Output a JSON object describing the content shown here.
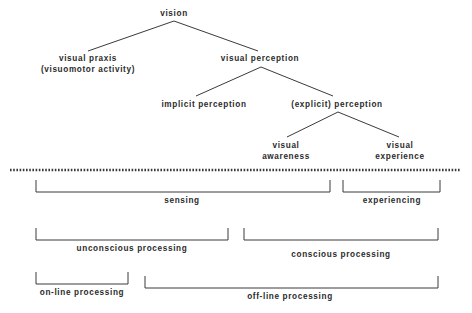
{
  "figure": {
    "ink_color": "#3a3a3a",
    "text_color": "#2b2b2b",
    "background": "#ffffff"
  },
  "tree": {
    "nodes": [
      {
        "id": "vision",
        "label": "vision",
        "x": 174,
        "y": 13,
        "level": 0
      },
      {
        "id": "visual-praxis",
        "label": "visual praxis",
        "x": 88,
        "y": 58,
        "level": 1
      },
      {
        "id": "visuomotor-activity",
        "label": "(visuomotor activity)",
        "x": 88,
        "y": 70,
        "level": 1
      },
      {
        "id": "visual-perception",
        "label": "visual perception",
        "x": 260,
        "y": 58,
        "level": 1
      },
      {
        "id": "implicit-perception",
        "label": "implicit perception",
        "x": 204,
        "y": 104,
        "level": 2
      },
      {
        "id": "explicit-perception",
        "label": "(explicit) perception",
        "x": 337,
        "y": 104,
        "level": 2
      },
      {
        "id": "visual-awareness-1",
        "label": "visual",
        "x": 286,
        "y": 145,
        "level": 3
      },
      {
        "id": "visual-awareness-2",
        "label": "awareness",
        "x": 286,
        "y": 155,
        "level": 3
      },
      {
        "id": "visual-experience-1",
        "label": "visual",
        "x": 400,
        "y": 145,
        "level": 3
      },
      {
        "id": "visual-experience-2",
        "label": "experience",
        "x": 400,
        "y": 155,
        "level": 3
      }
    ],
    "edges": [
      {
        "from": "vision",
        "to": "visual-praxis"
      },
      {
        "from": "vision",
        "to": "visual-perception"
      },
      {
        "from": "visual-perception",
        "to": "implicit-perception"
      },
      {
        "from": "visual-perception",
        "to": "explicit-perception"
      },
      {
        "from": "explicit-perception",
        "to": "visual-awareness"
      },
      {
        "from": "explicit-perception",
        "to": "visual-experience"
      }
    ]
  },
  "divider": {
    "name": "dotted-divider",
    "style": "dotted",
    "x_start": 10,
    "x_end": 461,
    "y": 170
  },
  "brackets": [
    {
      "id": "sensing",
      "label": "sensing",
      "x_start": 36,
      "x_end": 330,
      "top": 180,
      "bottom": 192,
      "label_x": 182,
      "label_y": 196,
      "row": 1
    },
    {
      "id": "experiencing",
      "label": "experiencing",
      "x_start": 343,
      "x_end": 440,
      "top": 180,
      "bottom": 192,
      "label_x": 392,
      "label_y": 196,
      "row": 1
    },
    {
      "id": "unconscious-processing",
      "label": "unconscious processing",
      "x_start": 36,
      "x_end": 228,
      "top": 228,
      "bottom": 240,
      "label_x": 132,
      "label_y": 244,
      "row": 2
    },
    {
      "id": "conscious-processing",
      "label": "conscious processing",
      "x_start": 244,
      "x_end": 438,
      "top": 228,
      "bottom": 240,
      "label_x": 341,
      "label_y": 250,
      "row": 2
    },
    {
      "id": "on-line-processing",
      "label": "on-line processing",
      "x_start": 36,
      "x_end": 128,
      "top": 272,
      "bottom": 284,
      "label_x": 82,
      "label_y": 288,
      "row": 3
    },
    {
      "id": "off-line-processing",
      "label": "off-line processing",
      "x_start": 145,
      "x_end": 438,
      "top": 276,
      "bottom": 288,
      "label_x": 290,
      "label_y": 292,
      "row": 3
    }
  ]
}
